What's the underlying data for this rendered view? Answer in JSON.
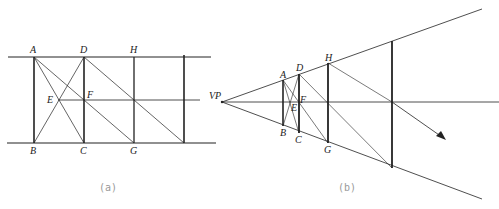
{
  "figure_a": {
    "caption": "(a)",
    "labels": {
      "A": "A",
      "B": "B",
      "C": "C",
      "D": "D",
      "E": "E",
      "F": "F",
      "G": "G",
      "H": "H"
    }
  },
  "figure_b": {
    "caption": "(b)",
    "labels": {
      "VP": "VP",
      "A": "A",
      "B": "B",
      "C": "C",
      "D": "D",
      "E": "E",
      "F": "F",
      "G": "G",
      "H": "H"
    }
  },
  "colors": {
    "line": "#222222",
    "caption": "#999999",
    "background": "#ffffff"
  }
}
